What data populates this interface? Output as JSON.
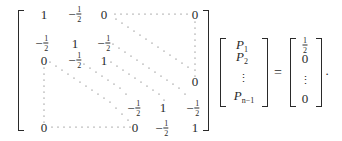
{
  "equation": {
    "matrix": {
      "row1": {
        "c1": "1",
        "c2_sign": "−",
        "c2_num": "1",
        "c2_den": "2",
        "c3": "0",
        "cn": "0"
      },
      "row2": {
        "c1_sign": "−",
        "c1_num": "1",
        "c1_den": "2",
        "c2": "1",
        "c3_sign": "−",
        "c3_num": "1",
        "c3_den": "2"
      },
      "row3": {
        "c1": "0",
        "c2_sign": "−",
        "c2_num": "1",
        "c2_den": "2",
        "c3": "1"
      },
      "row_n_minus_2": {
        "cn": "0"
      },
      "row_n_minus_1": {
        "a_sign": "−",
        "a_num": "1",
        "a_den": "2",
        "b": "1",
        "c_sign": "−",
        "c_num": "1",
        "c_den": "2"
      },
      "row_n": {
        "c1": "0",
        "a": "0",
        "b_sign": "−",
        "b_num": "1",
        "b_den": "2",
        "c": "1"
      }
    },
    "vector_p": {
      "entries": [
        {
          "symbol": "P",
          "subscript": "1"
        },
        {
          "symbol": "P",
          "subscript": "2"
        },
        {
          "symbol": "⋮",
          "subscript": ""
        },
        {
          "symbol": "P",
          "subscript": "n−1"
        }
      ]
    },
    "equals": "=",
    "rhs": {
      "first_num": "1",
      "first_den": "2",
      "second": "0",
      "vdots": "⋮",
      "last": "0"
    },
    "terminator": "."
  }
}
